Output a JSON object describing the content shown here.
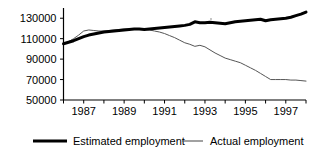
{
  "chart_data": {
    "type": "line",
    "title": "",
    "subtitle": "",
    "xlabel": "",
    "ylabel": "",
    "grid": false,
    "legend_position": "bottom",
    "xlim": [
      1986.0,
      1998.0
    ],
    "ylim": [
      50000,
      140000
    ],
    "yticks": [
      50000,
      70000,
      90000,
      110000,
      130000
    ],
    "ytick_labels": [
      "50000",
      "70000",
      "90000",
      "110000",
      "130000"
    ],
    "xticks": [
      1986,
      1987,
      1988,
      1989,
      1990,
      1991,
      1992,
      1993,
      1994,
      1995,
      1996,
      1997,
      1998
    ],
    "xtick_labels": [
      "",
      "1987",
      "",
      "1989",
      "",
      "1991",
      "",
      "1993",
      "",
      "1995",
      "",
      "1997",
      ""
    ],
    "x": [
      1986.0,
      1986.25,
      1986.5,
      1986.75,
      1987.0,
      1987.25,
      1987.5,
      1987.75,
      1988.0,
      1988.25,
      1988.5,
      1988.75,
      1989.0,
      1989.25,
      1989.5,
      1989.75,
      1990.0,
      1990.25,
      1990.5,
      1990.75,
      1991.0,
      1991.25,
      1991.5,
      1991.75,
      1992.0,
      1992.25,
      1992.5,
      1992.75,
      1993.0,
      1993.25,
      1993.5,
      1993.75,
      1994.0,
      1994.25,
      1994.5,
      1994.75,
      1995.0,
      1995.25,
      1995.5,
      1995.75,
      1996.0,
      1996.25,
      1996.5,
      1996.75,
      1997.0,
      1997.25,
      1997.5,
      1997.75,
      1998.0
    ],
    "series": [
      {
        "name": "Estimated employment",
        "style": "thick-black",
        "color": "#000000",
        "values": [
          105000,
          106500,
          108000,
          110000,
          112000,
          113500,
          114500,
          115500,
          116500,
          117000,
          117500,
          118000,
          118500,
          119000,
          119500,
          119500,
          119000,
          119500,
          120000,
          120500,
          121000,
          121500,
          122000,
          122500,
          123000,
          124000,
          126500,
          125500,
          125500,
          126000,
          125500,
          125000,
          124500,
          125500,
          126500,
          127000,
          127500,
          128000,
          128500,
          129000,
          127500,
          128500,
          129000,
          129500,
          130000,
          131000,
          132500,
          134000,
          136000
        ]
      },
      {
        "name": "Actual employment",
        "style": "thin-grey",
        "color": "#555555",
        "values": [
          104500,
          107000,
          110000,
          113500,
          117500,
          118500,
          118000,
          117500,
          117500,
          118000,
          118500,
          119000,
          119500,
          119500,
          119000,
          119500,
          119000,
          118500,
          117500,
          116500,
          115000,
          113000,
          111000,
          108500,
          106000,
          104500,
          102500,
          103500,
          102000,
          99000,
          96000,
          93500,
          91000,
          89500,
          88000,
          86500,
          84000,
          81500,
          79000,
          76000,
          73000,
          70000,
          70000,
          70000,
          70000,
          69500,
          69500,
          69000,
          68500
        ]
      }
    ]
  },
  "legend": {
    "items": [
      {
        "label": "Estimated employment"
      },
      {
        "label": "Actual employment"
      }
    ]
  }
}
